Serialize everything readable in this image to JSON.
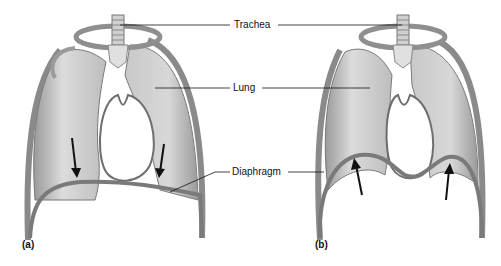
{
  "figure": {
    "labels": {
      "trachea": "Trachea",
      "lung": "Lung",
      "diaphragm": "Diaphragm"
    },
    "panels": [
      {
        "id": "a",
        "label": "(a)",
        "description": "Diaphragm contracted and flattened; arrows point downward"
      },
      {
        "id": "b",
        "label": "(b)",
        "description": "Diaphragm relaxed and dome-shaped; arrows point upward"
      }
    ],
    "colors": {
      "tissue": "#d9d9d9",
      "tissue_dark": "#a8a8a8",
      "outline": "#6e6e6e",
      "leader_line": "#111111",
      "arrow": "#111111"
    }
  }
}
